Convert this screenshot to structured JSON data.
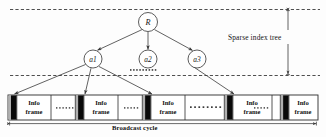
{
  "figure": {
    "colors": {
      "line": "#3a3a3a",
      "dashed": "#2f2f2f",
      "index_block": "#0a0a0a",
      "index_block_gray": "#a8a8a8",
      "frame_fill": "#ffffff",
      "bar_border": "#2b2b2b",
      "text": "#141414"
    }
  },
  "tree": {
    "root": {
      "label": "R",
      "cx": 148,
      "cy": 22,
      "r": 9.5
    },
    "children": [
      {
        "label": "a1",
        "cx": 93,
        "cy": 59,
        "r": 9.0
      },
      {
        "label": "a2",
        "cx": 148,
        "cy": 59,
        "r": 9.0
      },
      {
        "label": "a3",
        "cx": 197,
        "cy": 59,
        "r": 9.0
      }
    ],
    "sibling_ellipsis": {
      "dots": 9,
      "x_start": 130,
      "y": 70,
      "spacing": 3.1
    }
  },
  "annotations": {
    "sparse_index_tree": "Sparse index tree",
    "broadcast_cycle": "Broadcast cycle"
  },
  "broadcast_bar": {
    "x": 8,
    "y": 95,
    "width": 310,
    "height": 25,
    "segments": [
      {
        "type": "index",
        "label": "",
        "x": 8,
        "w": 9
      },
      {
        "type": "frame",
        "label": "Info frame",
        "x": 17,
        "w": 37
      },
      {
        "type": "dots",
        "label": "……",
        "x": 54,
        "w": 26,
        "dots": 6
      },
      {
        "type": "index",
        "label": "",
        "x": 80,
        "w": 9
      },
      {
        "type": "frame",
        "label": "Info frame",
        "x": 89,
        "w": 37
      },
      {
        "type": "dots",
        "label": "……",
        "x": 126,
        "w": 24,
        "dots": 5
      },
      {
        "type": "index",
        "label": "",
        "x": 150,
        "w": 9
      },
      {
        "type": "frame",
        "label": "Info frame",
        "x": 159,
        "w": 37
      },
      {
        "type": "dots",
        "label": "…………",
        "x": 196,
        "w": 78,
        "dots": 10
      },
      {
        "type": "index",
        "label": "",
        "x": 231,
        "w": 9
      },
      {
        "type": "frame",
        "label": "Info frame",
        "x": 240,
        "w": 37
      },
      {
        "type": "dots",
        "label": "……",
        "x": 277,
        "w": 22,
        "dots": 5
      },
      {
        "type": "index",
        "label": "",
        "x": 282,
        "w": 9
      },
      {
        "type": "frame",
        "label": "Info frame",
        "x": 291,
        "w": 27
      }
    ],
    "frame_label_line1": "Info",
    "frame_label_line2": "frame"
  }
}
